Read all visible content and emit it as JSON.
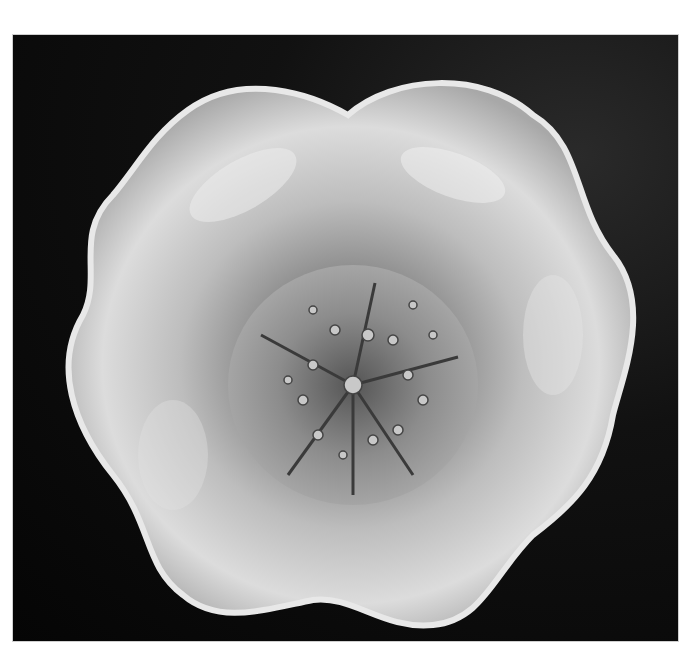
{
  "image": {
    "alt": "Top-down black and white photograph of a ruffled iridescent glass bowl with an embossed starfish / sea-urchin star pattern in the center, on a dark fabric background",
    "subject": "ruffled glass bowl",
    "center_motif": "five-pointed star with beaded dots",
    "background": "dark cloth",
    "colors": {
      "background": "#080808",
      "glass_light": "#d9d9d9",
      "glass_mid": "#9a9a9a",
      "center": "#7a7a7a"
    }
  }
}
